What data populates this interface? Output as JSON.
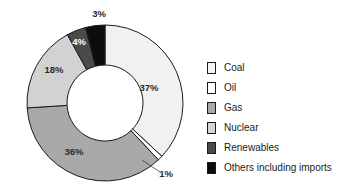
{
  "chart_data": {
    "type": "pie",
    "variant": "donut",
    "title": "",
    "subtitle": "",
    "xlabel": "",
    "ylabel": "",
    "units": "percent",
    "legend_position": "right",
    "grid": false,
    "categories": [
      "Coal",
      "Oil",
      "Gas",
      "Nuclear",
      "Renewables",
      "Others including imports"
    ],
    "values": [
      37,
      1,
      36,
      18,
      4,
      3
    ],
    "value_labels": [
      "37%",
      "1%",
      "36%",
      "18%",
      "4%",
      "3%"
    ],
    "colors": [
      "#f1f1f1",
      "#ffffff",
      "#a9a9a9",
      "#d2d2d2",
      "#4a4a4a",
      "#0d0d0d"
    ],
    "slices": [
      {
        "name": "Coal",
        "value": 37,
        "label": "37%",
        "color": "#f1f1f1",
        "label_color": "dark",
        "start_angle": 0,
        "end_angle": 133.2,
        "label_x": 149,
        "label_y": 88,
        "has_leader": false
      },
      {
        "name": "Oil",
        "value": 1,
        "label": "1%",
        "color": "#ffffff",
        "label_color": "dark",
        "start_angle": 133.2,
        "end_angle": 136.8,
        "label_x": 166,
        "label_y": 174,
        "has_leader": true,
        "leader": "M 142 160 L 160 172"
      },
      {
        "name": "Gas",
        "value": 36,
        "label": "36%",
        "color": "#a9a9a9",
        "label_color": "dark",
        "start_angle": 136.8,
        "end_angle": 266.4,
        "label_x": 74,
        "label_y": 152,
        "has_leader": false
      },
      {
        "name": "Nuclear",
        "value": 18,
        "label": "18%",
        "color": "#d2d2d2",
        "label_color": "dark",
        "start_angle": 266.4,
        "end_angle": 331.2,
        "label_x": 54,
        "label_y": 70,
        "has_leader": false
      },
      {
        "name": "Renewables",
        "value": 4,
        "label": "4%",
        "color": "#4a4a4a",
        "label_color": "light",
        "start_angle": 331.2,
        "end_angle": 345.6,
        "label_x": 79,
        "label_y": 42,
        "has_leader": false
      },
      {
        "name": "Others including imports",
        "value": 3,
        "label": "3%",
        "color": "#0d0d0d",
        "label_color": "dark",
        "start_angle": 345.6,
        "end_angle": 360,
        "label_x": 99,
        "label_y": 14,
        "has_leader": false
      }
    ],
    "geometry": {
      "center_x": 105,
      "center_y": 103,
      "outer_radius": 78,
      "inner_radius": 38
    }
  },
  "legend": {
    "items": [
      {
        "label": "Coal",
        "color": "#f6f6f6"
      },
      {
        "label": "Oil",
        "color": "#ffffff"
      },
      {
        "label": "Gas",
        "color": "#a9a9a9"
      },
      {
        "label": "Nuclear",
        "color": "#d2d2d2"
      },
      {
        "label": "Renewables",
        "color": "#4a4a4a"
      },
      {
        "label": "Others including imports",
        "color": "#0d0d0d"
      }
    ]
  }
}
